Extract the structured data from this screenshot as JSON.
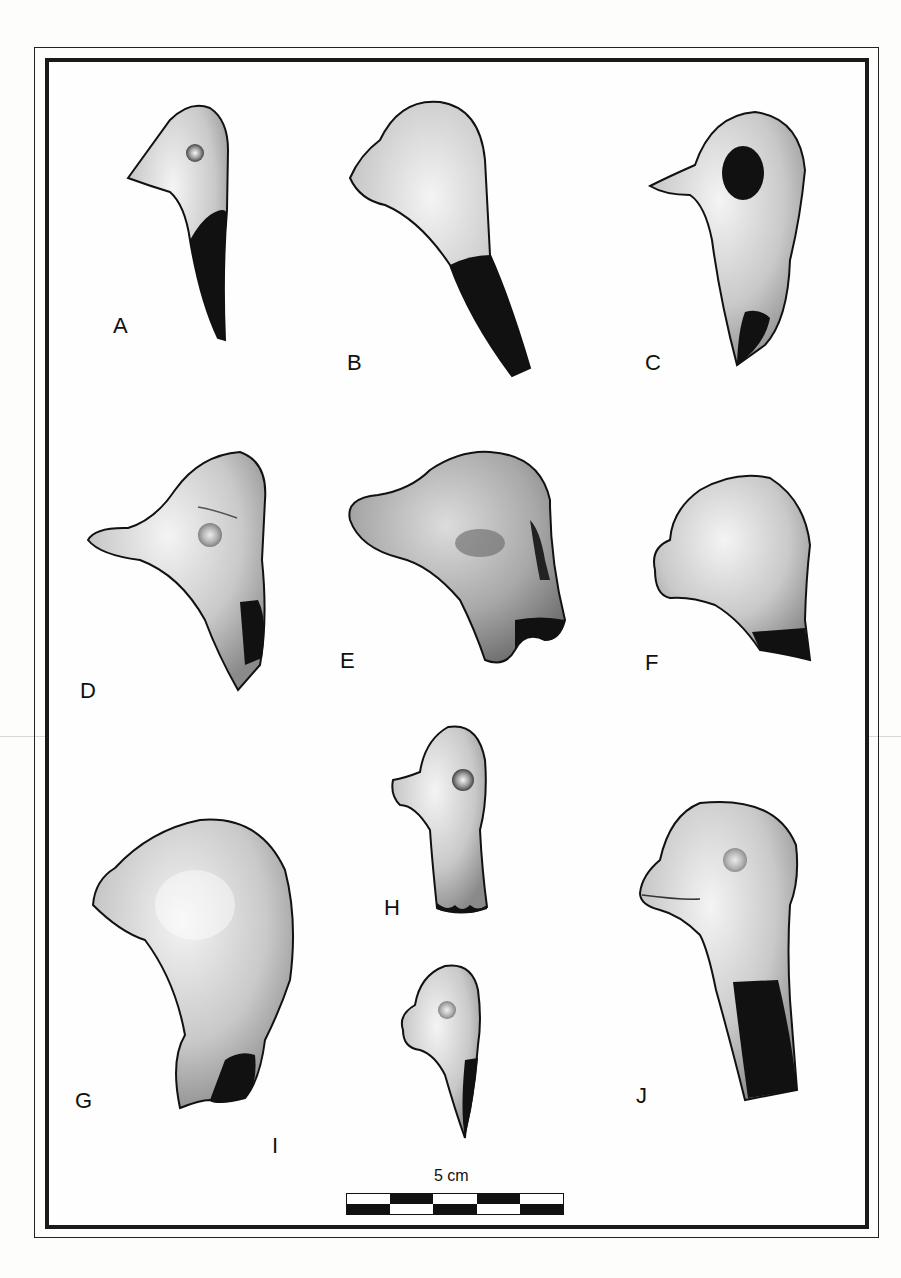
{
  "plate": {
    "frame": {
      "outer_color": "#222222",
      "inner_color": "#1a1a1a",
      "background": "#fefefe"
    },
    "figures": [
      {
        "id": "A",
        "label": "A",
        "label_pos": [
          113,
          315
        ],
        "description": "small bird-head figurine fragment, eye pellet, dark broken neck"
      },
      {
        "id": "B",
        "label": "B",
        "label_pos": [
          347,
          352
        ],
        "description": "bird-head figurine, pointed beak, dark broken neck"
      },
      {
        "id": "C",
        "label": "C",
        "label_pos": [
          645,
          352
        ],
        "description": "bird-head figurine with large dark eye hole, pointed beak"
      },
      {
        "id": "D",
        "label": "D",
        "label_pos": [
          80,
          680
        ],
        "description": "bird-head figurine with incised line, long beak"
      },
      {
        "id": "E",
        "label": "E",
        "label_pos": [
          340,
          650
        ],
        "description": "heavily stippled head with rounded snout"
      },
      {
        "id": "F",
        "label": "F",
        "label_pos": [
          645,
          652
        ],
        "description": "rounded head fragment with dark broken base"
      },
      {
        "id": "G",
        "label": "G",
        "label_pos": [
          75,
          1090
        ],
        "description": "large rounded head with neck"
      },
      {
        "id": "H",
        "label": "H",
        "label_pos": [
          384,
          897
        ],
        "description": "head on columnar neck, eye pellet"
      },
      {
        "id": "I",
        "label": "I",
        "label_pos": [
          272,
          1135
        ],
        "description": "small pointed head fragment"
      },
      {
        "id": "J",
        "label": "J",
        "label_pos": [
          636,
          1085
        ],
        "description": "head with incised mouth line on tall neck, dark broken side"
      }
    ],
    "scale": {
      "label": "5 cm",
      "segments": 5,
      "colors": {
        "dark": "#111111",
        "light": "#ffffff"
      }
    }
  }
}
